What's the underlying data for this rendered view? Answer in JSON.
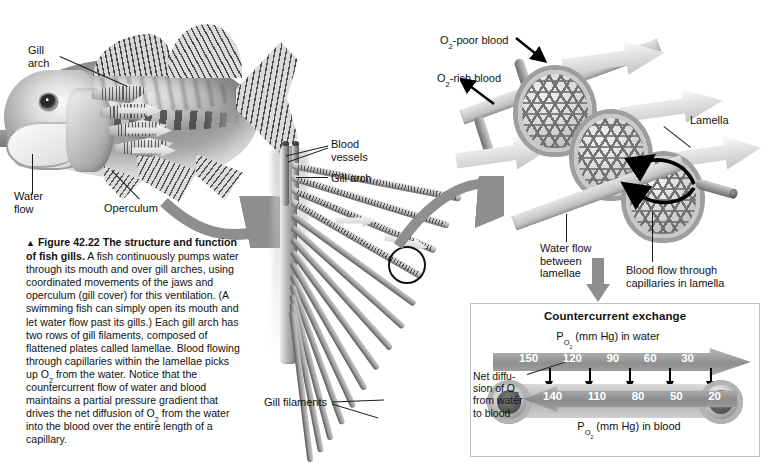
{
  "figure": {
    "marker": "▲",
    "number": "Figure 42.22",
    "title": "The structure and function of fish gills.",
    "body": "A fish continuously pumps water through its mouth and over gill arches, using coordinated movements of the jaws and operculum (gill cover) for this ventilation. (A swimming fish can simply open its mouth and let water flow past its gills.) Each gill arch has two rows of gill filaments, composed of flattened plates called lamellae. Blood flowing through capillaries within the lamellae picks up O2 from the water. Notice that the countercurrent flow of water and blood maintains a partial pressure gradient that drives the net diffusion of O2 from the water into the blood over the entire length of a capillary."
  },
  "fish_panel": {
    "labels": {
      "gill_arch": "Gill\narch",
      "water_flow": "Water\nflow",
      "operculum": "Operculum"
    }
  },
  "arch_panel": {
    "labels": {
      "blood_vessels": "Blood\nvessels",
      "gill_arch": "Gill arch",
      "gill_filaments": "Gill filaments"
    }
  },
  "lamellae_panel": {
    "labels": {
      "o2_poor_blood": "O2-poor blood",
      "o2_rich_blood": "O2-rich blood",
      "lamella": "Lamella",
      "water_flow_between_lamellae": "Water flow\nbetween\nlamellae",
      "blood_flow_capillaries": "Blood flow through\ncapillaries in lamella"
    }
  },
  "countercurrent": {
    "title": "Countercurrent exchange",
    "water_axis_label": "PO2 (mm Hg) in water",
    "blood_axis_label": "PO2 (mm Hg) in blood",
    "net_diffusion_label": "Net diffu-\nsion of O2\nfrom water\nto blood",
    "water_direction": "left-to-right",
    "blood_direction": "right-to-left",
    "chart_data": {
      "type": "line",
      "title": "Countercurrent exchange",
      "xlabel": "Position along capillary",
      "ylabel": "PO2 (mm Hg)",
      "categories": [
        "1",
        "2",
        "3",
        "4",
        "5"
      ],
      "series": [
        {
          "name": "PO2 (mm Hg) in water",
          "values": [
            150,
            120,
            90,
            60,
            30
          ]
        },
        {
          "name": "PO2 (mm Hg) in blood",
          "values": [
            140,
            110,
            80,
            50,
            20
          ]
        }
      ],
      "gradient_difference": [
        10,
        10,
        10,
        10,
        10
      ],
      "diffusion_arrow_count": 5,
      "grid": false,
      "legend": "inline"
    }
  },
  "colors": {
    "background": "#ffffff",
    "text": "#111111",
    "arrow_fill": "#8f8f8f",
    "box_border": "#c4c4c4",
    "number_text": "#ffffff"
  }
}
